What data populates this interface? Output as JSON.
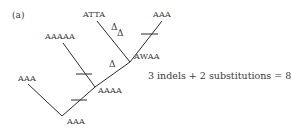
{
  "panel_label": "(a)",
  "nodes": {
    "leaf_atta": "ATTA",
    "leaf_aaa_top": "AAA",
    "internal_awaa": "AWAA",
    "leaf_aaaaa": "AAAAA",
    "internal_aaaa": "AAAA",
    "leaf_aaa_left": "AAA",
    "root_aaa": "AAA"
  },
  "indel_marks": {
    "atta_branch_1": "Δ",
    "atta_branch_2": "Δ",
    "awaa_branch": "Δ"
  },
  "summary": "3 indels + 2 substitutions = 8",
  "colors": {
    "line": "#2c2c2c",
    "text": "#3a3a3a",
    "background": "#ffffff"
  }
}
